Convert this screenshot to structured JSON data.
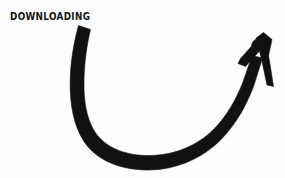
{
  "canvas": {
    "width": 285,
    "height": 178,
    "background_color": "#fdfdfd",
    "ink_color": "#111111"
  },
  "caption": {
    "text": "DOWNLOADING",
    "color": "#151515",
    "position": {
      "x": 10,
      "y": 9
    }
  },
  "arrow": {
    "name": "curved-upward-arrow",
    "style": "hand-drawn marker sketch",
    "color": "#111111",
    "description": "Thick hand-drawn arc sweeping from upper-left down through a U-shaped bottom and rising steeply to an arrowhead at the upper right pointing up-right",
    "tail_start": {
      "x": 78,
      "y": 26
    },
    "lowest_point": {
      "x": 146,
      "y": 162
    },
    "leftmost_point": {
      "x": 72,
      "y": 110
    },
    "tip": {
      "x": 263,
      "y": 33
    },
    "barb_left_end": {
      "x": 239,
      "y": 63
    },
    "barb_right_end": {
      "x": 274,
      "y": 86
    },
    "stroke_width_min": 4,
    "stroke_width_max": 16
  }
}
